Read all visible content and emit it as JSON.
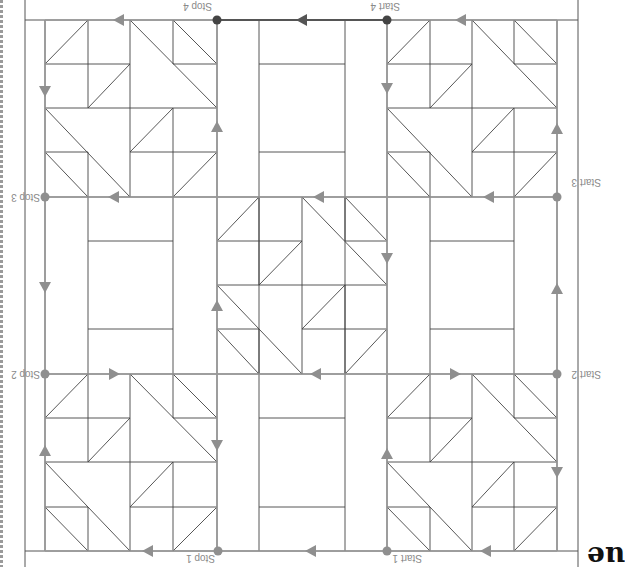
{
  "page": {
    "orientation": "rotated-180",
    "heading_fragment": "ue",
    "colors": {
      "background": "#ffffff",
      "grid_line": "#444444",
      "path_line": "#9a9a9a",
      "path_active": "#555555",
      "marker": "#8f8f8f",
      "marker_active": "#444444",
      "label": "#8a8a8a"
    }
  },
  "diagram": {
    "labels": {
      "start1": "Start 1",
      "stop1": "Stop 1",
      "start2": "Start 2",
      "stop2": "Stop 2",
      "start3": "Start 3",
      "stop3": "Stop 3",
      "start4": "Start 4",
      "stop4": "Stop 4"
    },
    "blocks": [
      {
        "name": "pinwheel-top-left",
        "type": "pinwheel"
      },
      {
        "name": "pinwheel-top-right",
        "type": "pinwheel"
      },
      {
        "name": "pinwheel-center",
        "type": "pinwheel"
      },
      {
        "name": "pinwheel-bottom-left",
        "type": "pinwheel"
      },
      {
        "name": "pinwheel-bottom-right",
        "type": "pinwheel"
      },
      {
        "name": "sashing-top",
        "type": "rectangle-frame"
      },
      {
        "name": "sashing-left",
        "type": "rectangle-frame"
      },
      {
        "name": "sashing-right",
        "type": "rectangle-frame"
      },
      {
        "name": "sashing-bottom",
        "type": "rectangle-frame"
      }
    ]
  }
}
